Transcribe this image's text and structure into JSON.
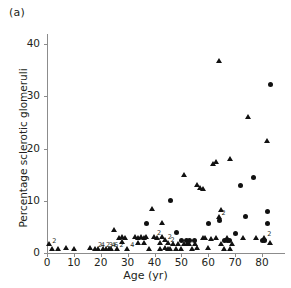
{
  "panel": {
    "label": "(a)"
  },
  "chart_data": {
    "type": "scatter",
    "title": "",
    "xlabel": "Age (yr)",
    "ylabel": "Percentage sclerotic glomeruli",
    "xlim": [
      0,
      88
    ],
    "ylim": [
      0,
      44
    ],
    "xticks": [
      0,
      10,
      20,
      30,
      40,
      50,
      60,
      70,
      80
    ],
    "yticks": [
      0,
      10,
      20,
      30,
      40
    ],
    "grid": false,
    "legend": "none",
    "marker_types": [
      "triangle",
      "circle"
    ],
    "marker_color": "#111111",
    "series": [
      {
        "name": "triangle",
        "marker": "triangle",
        "points": [
          {
            "x": 1,
            "y": 1.2,
            "n": 2
          },
          {
            "x": 2,
            "y": 0.4
          },
          {
            "x": 4,
            "y": 0.3
          },
          {
            "x": 7,
            "y": 0.5
          },
          {
            "x": 10,
            "y": 0.4
          },
          {
            "x": 16,
            "y": 0.5
          },
          {
            "x": 18,
            "y": 0.4,
            "n": 2
          },
          {
            "x": 19,
            "y": 0.3,
            "n": 4
          },
          {
            "x": 21,
            "y": 0.4,
            "n": 2
          },
          {
            "x": 22,
            "y": 0.3,
            "n": 3
          },
          {
            "x": 23,
            "y": 0.4,
            "n": 4
          },
          {
            "x": 24,
            "y": 0.3,
            "n": 6
          },
          {
            "x": 25,
            "y": 4.0
          },
          {
            "x": 26,
            "y": 0.4,
            "n": 2
          },
          {
            "x": 27,
            "y": 2.4
          },
          {
            "x": 28,
            "y": 2.6
          },
          {
            "x": 28,
            "y": 1.6
          },
          {
            "x": 29,
            "y": 2.5
          },
          {
            "x": 30,
            "y": 0.4,
            "n": 4
          },
          {
            "x": 33,
            "y": 2.6
          },
          {
            "x": 34,
            "y": 2.5
          },
          {
            "x": 34,
            "y": 1.4
          },
          {
            "x": 35,
            "y": 2.6
          },
          {
            "x": 36,
            "y": 2.5
          },
          {
            "x": 36,
            "y": 1.4
          },
          {
            "x": 37,
            "y": 2.6
          },
          {
            "x": 38,
            "y": 0.4
          },
          {
            "x": 39,
            "y": 8.0
          },
          {
            "x": 40,
            "y": 2.6,
            "n": 2
          },
          {
            "x": 41,
            "y": 2.5
          },
          {
            "x": 42,
            "y": 1.4
          },
          {
            "x": 42,
            "y": 0.4
          },
          {
            "x": 43,
            "y": 5.2
          },
          {
            "x": 43,
            "y": 2.6
          },
          {
            "x": 44,
            "y": 2.0,
            "n": 2
          },
          {
            "x": 44,
            "y": 0.5
          },
          {
            "x": 45,
            "y": 1.4,
            "n": 2
          },
          {
            "x": 45,
            "y": 0.4
          },
          {
            "x": 46,
            "y": 0.3
          },
          {
            "x": 47,
            "y": 1.3
          },
          {
            "x": 48,
            "y": 0.4
          },
          {
            "x": 49,
            "y": 1.2
          },
          {
            "x": 50,
            "y": 0.4
          },
          {
            "x": 51,
            "y": 14.5
          },
          {
            "x": 51,
            "y": 1.3
          },
          {
            "x": 52,
            "y": 1.2
          },
          {
            "x": 53,
            "y": 1.3
          },
          {
            "x": 54,
            "y": 0.4
          },
          {
            "x": 55,
            "y": 1.3
          },
          {
            "x": 56,
            "y": 12.5
          },
          {
            "x": 56,
            "y": 0.5
          },
          {
            "x": 57,
            "y": 12.0
          },
          {
            "x": 58,
            "y": 11.8
          },
          {
            "x": 58,
            "y": 2.5
          },
          {
            "x": 59,
            "y": 2.4
          },
          {
            "x": 60,
            "y": 0.5
          },
          {
            "x": 61,
            "y": 2.3
          },
          {
            "x": 62,
            "y": 16.5
          },
          {
            "x": 63,
            "y": 17.0
          },
          {
            "x": 63,
            "y": 2.4
          },
          {
            "x": 64,
            "y": 6.5,
            "n": 2
          },
          {
            "x": 64,
            "y": 36.2
          },
          {
            "x": 65,
            "y": 7.7
          },
          {
            "x": 65,
            "y": 1.3
          },
          {
            "x": 66,
            "y": 0.4
          },
          {
            "x": 67,
            "y": 2.4
          },
          {
            "x": 68,
            "y": 17.5
          },
          {
            "x": 68,
            "y": 0.4
          },
          {
            "x": 69,
            "y": 1.2
          },
          {
            "x": 73,
            "y": 2.4
          },
          {
            "x": 75,
            "y": 25.5
          },
          {
            "x": 78,
            "y": 2.4
          },
          {
            "x": 81,
            "y": 2.4,
            "n": 2
          },
          {
            "x": 82,
            "y": 21.0
          },
          {
            "x": 83,
            "y": 1.4
          }
        ]
      },
      {
        "name": "circle",
        "marker": "circle",
        "points": [
          {
            "x": 37,
            "y": 5.6
          },
          {
            "x": 46,
            "y": 10.0
          },
          {
            "x": 48,
            "y": 4.0
          },
          {
            "x": 50,
            "y": 2.4
          },
          {
            "x": 52,
            "y": 2.4
          },
          {
            "x": 53,
            "y": 2.3
          },
          {
            "x": 55,
            "y": 2.3
          },
          {
            "x": 60,
            "y": 5.6
          },
          {
            "x": 64,
            "y": 6.3
          },
          {
            "x": 66,
            "y": 2.4
          },
          {
            "x": 67,
            "y": 2.4
          },
          {
            "x": 68,
            "y": 2.4
          },
          {
            "x": 70,
            "y": 3.8
          },
          {
            "x": 72,
            "y": 13.0
          },
          {
            "x": 74,
            "y": 7.0
          },
          {
            "x": 77,
            "y": 14.5
          },
          {
            "x": 80,
            "y": 2.4
          },
          {
            "x": 81,
            "y": 2.4
          },
          {
            "x": 82,
            "y": 8.0
          },
          {
            "x": 82,
            "y": 5.6
          },
          {
            "x": 83,
            "y": 32.3
          }
        ]
      }
    ]
  }
}
